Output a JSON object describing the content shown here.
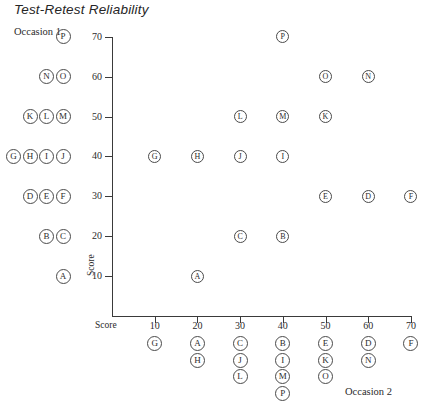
{
  "chart_data": {
    "type": "scatter",
    "title": "Test-Retest Reliability",
    "xlabel": "Occasion 2",
    "ylabel": "Occasion 1",
    "x_axis_name": "Score",
    "y_axis_name": "Score",
    "xlim": [
      0,
      75
    ],
    "ylim": [
      0,
      75
    ],
    "xticks": [
      10,
      20,
      30,
      40,
      50,
      60,
      70
    ],
    "yticks": [
      10,
      20,
      30,
      40,
      50,
      60,
      70
    ],
    "grid": false,
    "legend": "none",
    "point_label_style": "circled-letter",
    "points": [
      {
        "label": "A",
        "x": 20,
        "y": 10
      },
      {
        "label": "B",
        "x": 40,
        "y": 20
      },
      {
        "label": "C",
        "x": 30,
        "y": 20
      },
      {
        "label": "D",
        "x": 60,
        "y": 30
      },
      {
        "label": "E",
        "x": 50,
        "y": 30
      },
      {
        "label": "F",
        "x": 70,
        "y": 30
      },
      {
        "label": "G",
        "x": 10,
        "y": 40
      },
      {
        "label": "H",
        "x": 20,
        "y": 40
      },
      {
        "label": "I",
        "x": 40,
        "y": 40
      },
      {
        "label": "J",
        "x": 30,
        "y": 40
      },
      {
        "label": "K",
        "x": 50,
        "y": 50
      },
      {
        "label": "L",
        "x": 30,
        "y": 50
      },
      {
        "label": "M",
        "x": 40,
        "y": 50
      },
      {
        "label": "N",
        "x": 60,
        "y": 60
      },
      {
        "label": "O",
        "x": 50,
        "y": 60
      },
      {
        "label": "P",
        "x": 40,
        "y": 70
      }
    ],
    "y_margin_stacks": [
      {
        "value": 70,
        "labels": [
          "P"
        ]
      },
      {
        "value": 60,
        "labels": [
          "N",
          "O"
        ]
      },
      {
        "value": 50,
        "labels": [
          "K",
          "L",
          "M"
        ]
      },
      {
        "value": 40,
        "labels": [
          "G",
          "H",
          "I",
          "J"
        ]
      },
      {
        "value": 30,
        "labels": [
          "D",
          "E",
          "F"
        ]
      },
      {
        "value": 20,
        "labels": [
          "B",
          "C"
        ]
      },
      {
        "value": 10,
        "labels": [
          "A"
        ]
      }
    ],
    "x_margin_stacks": [
      {
        "value": 10,
        "labels": [
          "G"
        ]
      },
      {
        "value": 20,
        "labels": [
          "A",
          "H"
        ]
      },
      {
        "value": 30,
        "labels": [
          "C",
          "J",
          "L"
        ]
      },
      {
        "value": 40,
        "labels": [
          "B",
          "I",
          "M",
          "P"
        ]
      },
      {
        "value": 50,
        "labels": [
          "E",
          "K",
          "O"
        ]
      },
      {
        "value": 60,
        "labels": [
          "D",
          "N"
        ]
      },
      {
        "value": 70,
        "labels": [
          "F"
        ]
      }
    ]
  },
  "colors": {
    "axis": "#3a3a3a",
    "marker_stroke": "#4a4a4a",
    "text": "#2b2b2b",
    "title": "#262626",
    "background": "#ffffff"
  }
}
